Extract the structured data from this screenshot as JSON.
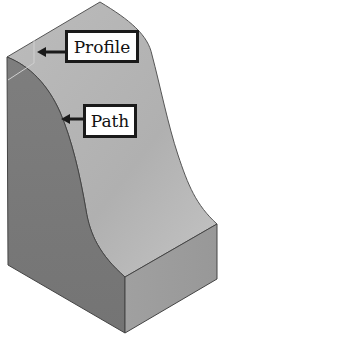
{
  "diagram": {
    "labels": {
      "profile": "Profile",
      "path": "Path"
    },
    "colors": {
      "background": "#ffffff",
      "top_face": "#b4b4b4",
      "left_face": "#7a7a7a",
      "front_face": "#9c9c9c",
      "edge": "#444444",
      "callout_border": "#1a1a1a",
      "arrow": "#1a1a1a"
    }
  }
}
